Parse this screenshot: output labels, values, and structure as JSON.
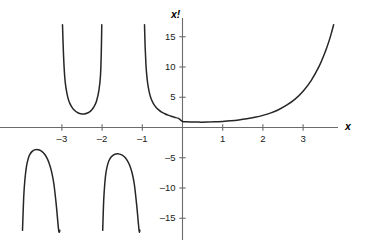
{
  "chart_data": {
    "type": "line",
    "title": "",
    "subtitle": "",
    "xlabel": "x",
    "ylabel": "x!",
    "xlim": [
      -3.85,
      3.85
    ],
    "ylim": [
      -17.0,
      17.0
    ],
    "grid": false,
    "legend": null,
    "xticks": [
      -3,
      -2,
      -1,
      1,
      2,
      3
    ],
    "xticklabels": [
      "–3",
      "–2",
      "–1",
      "1",
      "2",
      "3"
    ],
    "yticks": [
      15,
      10,
      5,
      -5,
      -10,
      -15
    ],
    "yticklabels": [
      "15",
      "10",
      "5",
      "–5",
      "–10",
      "–15"
    ],
    "line_color": "#262626",
    "axis_color": "#555555",
    "annotations": [],
    "series": [
      {
        "name": "x! = Γ(x+1)",
        "branch": "below -4 (negative lobe)",
        "points": [
          [
            -3.98,
            -17.0
          ],
          [
            -3.95,
            -11.5
          ],
          [
            -3.92,
            -8.6
          ],
          [
            -3.88,
            -6.4
          ],
          [
            -3.84,
            -5.2
          ],
          [
            -3.8,
            -4.5
          ],
          [
            -3.74,
            -3.95
          ],
          [
            -3.68,
            -3.7
          ],
          [
            -3.62,
            -3.63
          ],
          [
            -3.56,
            -3.72
          ],
          [
            -3.5,
            -3.95
          ],
          [
            -3.44,
            -4.35
          ],
          [
            -3.38,
            -4.95
          ],
          [
            -3.32,
            -5.85
          ],
          [
            -3.26,
            -7.2
          ],
          [
            -3.2,
            -9.3
          ],
          [
            -3.14,
            -12.8
          ],
          [
            -3.08,
            -19.5
          ],
          [
            -3.05,
            -17.0
          ]
        ]
      },
      {
        "name": "x! = Γ(x+1)",
        "branch": "-3 to -2 (positive lobe)",
        "points": [
          [
            -2.985,
            17.0
          ],
          [
            -2.96,
            12.0
          ],
          [
            -2.93,
            8.4
          ],
          [
            -2.9,
            6.6
          ],
          [
            -2.85,
            4.9
          ],
          [
            -2.8,
            3.95
          ],
          [
            -2.74,
            3.25
          ],
          [
            -2.68,
            2.8
          ],
          [
            -2.62,
            2.5
          ],
          [
            -2.56,
            2.32
          ],
          [
            -2.5,
            2.24
          ],
          [
            -2.44,
            2.25
          ],
          [
            -2.38,
            2.35
          ],
          [
            -2.32,
            2.55
          ],
          [
            -2.26,
            2.9
          ],
          [
            -2.2,
            3.45
          ],
          [
            -2.14,
            4.35
          ],
          [
            -2.08,
            6.1
          ],
          [
            -2.04,
            8.6
          ],
          [
            -2.02,
            12.5
          ],
          [
            -2.008,
            17.0
          ]
        ]
      },
      {
        "name": "x! = Γ(x+1)",
        "branch": "-2 to -1 (negative lobe)",
        "points": [
          [
            -1.985,
            -17.0
          ],
          [
            -1.96,
            -12.0
          ],
          [
            -1.93,
            -9.0
          ],
          [
            -1.9,
            -7.3
          ],
          [
            -1.85,
            -5.85
          ],
          [
            -1.8,
            -5.1
          ],
          [
            -1.74,
            -4.65
          ],
          [
            -1.68,
            -4.43
          ],
          [
            -1.62,
            -4.35
          ],
          [
            -1.56,
            -4.4
          ],
          [
            -1.5,
            -4.56
          ],
          [
            -1.44,
            -4.88
          ],
          [
            -1.38,
            -5.38
          ],
          [
            -1.32,
            -6.15
          ],
          [
            -1.26,
            -7.35
          ],
          [
            -1.2,
            -9.3
          ],
          [
            -1.14,
            -12.8
          ],
          [
            -1.08,
            -19.0
          ],
          [
            -1.06,
            -17.0
          ]
        ]
      },
      {
        "name": "x! = Γ(x+1)",
        "branch": "-1 to +3.8 (main branch)",
        "points": [
          [
            -0.945,
            17.0
          ],
          [
            -0.93,
            13.5
          ],
          [
            -0.91,
            10.5
          ],
          [
            -0.89,
            8.7
          ],
          [
            -0.86,
            7.0
          ],
          [
            -0.82,
            5.65
          ],
          [
            -0.78,
            4.75
          ],
          [
            -0.72,
            3.9
          ],
          [
            -0.66,
            3.35
          ],
          [
            -0.6,
            2.95
          ],
          [
            -0.52,
            2.55
          ],
          [
            -0.44,
            2.28
          ],
          [
            -0.36,
            2.05
          ],
          [
            -0.28,
            1.85
          ],
          [
            -0.2,
            1.68
          ],
          [
            -0.1,
            1.5
          ],
          [
            0.0,
            1.0
          ],
          [
            0.1,
            0.95
          ],
          [
            0.2,
            0.92
          ],
          [
            0.3,
            0.9
          ],
          [
            0.46,
            0.886
          ],
          [
            0.6,
            0.894
          ],
          [
            0.8,
            0.93
          ],
          [
            1.0,
            1.0
          ],
          [
            1.2,
            1.1
          ],
          [
            1.4,
            1.24
          ],
          [
            1.6,
            1.43
          ],
          [
            1.8,
            1.68
          ],
          [
            2.0,
            2.0
          ],
          [
            2.2,
            2.42
          ],
          [
            2.4,
            2.98
          ],
          [
            2.6,
            3.72
          ],
          [
            2.8,
            4.69
          ],
          [
            3.0,
            6.0
          ],
          [
            3.2,
            7.76
          ],
          [
            3.4,
            10.14
          ],
          [
            3.55,
            12.5
          ],
          [
            3.65,
            14.4
          ],
          [
            3.72,
            16.0
          ],
          [
            3.76,
            17.0
          ]
        ]
      }
    ],
    "asymptotes": [
      -1,
      -2,
      -3,
      -4
    ]
  },
  "axis": {
    "x_label": "x",
    "y_label": "x!"
  }
}
